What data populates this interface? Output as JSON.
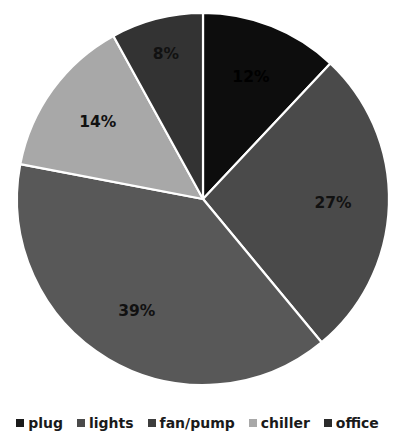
{
  "chart_data": {
    "type": "pie",
    "title": "",
    "subtitle": "",
    "xlabel": "",
    "ylabel": "",
    "grid": false,
    "legend_position": "bottom",
    "start_angle_deg": 0,
    "direction": "clockwise",
    "categories": [
      "plug",
      "lights",
      "fan/pump",
      "chiller",
      "office"
    ],
    "values": [
      12,
      27,
      39,
      14,
      8
    ],
    "value_unit": "%",
    "data_labels": [
      "12%",
      "27%",
      "39%",
      "14%",
      "8%"
    ],
    "colors": [
      "#0d0d0d",
      "#4a4a4a",
      "#585858",
      "#a8a8a8",
      "#333333"
    ],
    "slice_label_colors": [
      "#000000",
      "#111111",
      "#111111",
      "#111111",
      "#111111"
    ],
    "slices": [
      {
        "label": "plug",
        "value": 12,
        "data_label": "12%",
        "color": "#0d0d0d",
        "label_color": "#000000"
      },
      {
        "label": "lights",
        "value": 27,
        "data_label": "27%",
        "color": "#4a4a4a",
        "label_color": "#111111"
      },
      {
        "label": "fan/pump",
        "value": 39,
        "data_label": "39%",
        "color": "#585858",
        "label_color": "#111111"
      },
      {
        "label": "chiller",
        "value": 14,
        "data_label": "14%",
        "color": "#a8a8a8",
        "label_color": "#111111"
      },
      {
        "label": "office",
        "value": 8,
        "data_label": "8%",
        "color": "#333333",
        "label_color": "#111111"
      }
    ]
  },
  "legend": {
    "items": [
      {
        "label": "plug",
        "color": "#1a1a1a"
      },
      {
        "label": "lights",
        "color": "#4a4a4a"
      },
      {
        "label": "fan/pump",
        "color": "#3d3d3d"
      },
      {
        "label": "chiller",
        "color": "#a8a8a8"
      },
      {
        "label": "office",
        "color": "#2b2b2b"
      }
    ]
  },
  "style": {
    "background": "#ffffff",
    "slice_border_color": "#ffffff",
    "slice_border_width": 2.2
  }
}
